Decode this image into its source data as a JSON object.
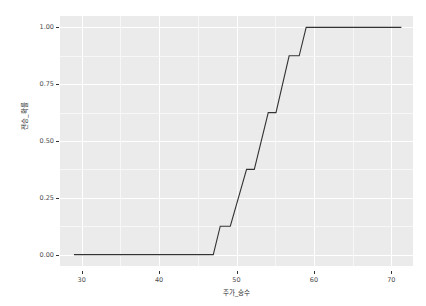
{
  "chart_data": {
    "type": "line",
    "title": "",
    "subtitle": "",
    "xlabel": "주가_승수",
    "ylabel": "전승_확률",
    "style": "step",
    "xlim": [
      27.2,
      72.8
    ],
    "ylim": [
      -0.05,
      1.05
    ],
    "xticks": [
      30,
      40,
      50,
      60,
      70
    ],
    "xtick_labels": [
      "30",
      "40",
      "50",
      "60",
      "70"
    ],
    "yticks": [
      0.0,
      0.25,
      0.5,
      0.75,
      1.0
    ],
    "ytick_labels": [
      "0.00",
      "0.25",
      "0.50",
      "0.75",
      "1.00"
    ],
    "xminor": [
      35,
      45,
      55,
      65
    ],
    "yminor": [
      0.125,
      0.375,
      0.625,
      0.875
    ],
    "grid": true,
    "legend": false,
    "panel_bg": "#EBEBEB",
    "grid_major_color": "#FFFFFF",
    "grid_minor_color": "#F7F7F7",
    "line_color": "#333333",
    "line_width": 1.1,
    "x": [
      29.0,
      47.0,
      47.6,
      49.1,
      49.1,
      51.3,
      51.3,
      52.2,
      52.2,
      54.0,
      54.0,
      55.0,
      55.0,
      56.7,
      56.7,
      58.0,
      58.0,
      59.0,
      71.3
    ],
    "y": [
      0.0,
      0.0,
      0.125,
      0.125,
      0.125,
      0.375,
      0.375,
      0.375,
      0.375,
      0.625,
      0.625,
      0.625,
      0.625,
      0.875,
      0.875,
      0.875,
      0.875,
      1.0,
      1.0
    ],
    "points": [
      {
        "x": 29.0,
        "y": 0.0
      },
      {
        "x": 47.0,
        "y": 0.0
      },
      {
        "x": 47.9,
        "y": 0.125
      },
      {
        "x": 49.2,
        "y": 0.125
      },
      {
        "x": 51.3,
        "y": 0.375
      },
      {
        "x": 52.3,
        "y": 0.375
      },
      {
        "x": 54.1,
        "y": 0.625
      },
      {
        "x": 55.1,
        "y": 0.625
      },
      {
        "x": 56.8,
        "y": 0.875
      },
      {
        "x": 58.1,
        "y": 0.875
      },
      {
        "x": 59.0,
        "y": 1.0
      },
      {
        "x": 71.3,
        "y": 1.0
      }
    ]
  }
}
